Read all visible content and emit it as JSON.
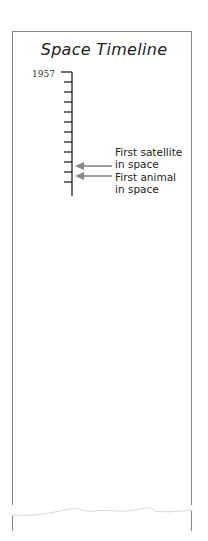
{
  "title": "Space Timeline",
  "timeline": {
    "start_year": "1957",
    "tick_count": 12,
    "axis_color": "#222222",
    "arrow_color": "#888888"
  },
  "events": [
    {
      "line1": "First satellite",
      "line2": "in space"
    },
    {
      "line1": "First animal",
      "line2": "in space"
    }
  ]
}
